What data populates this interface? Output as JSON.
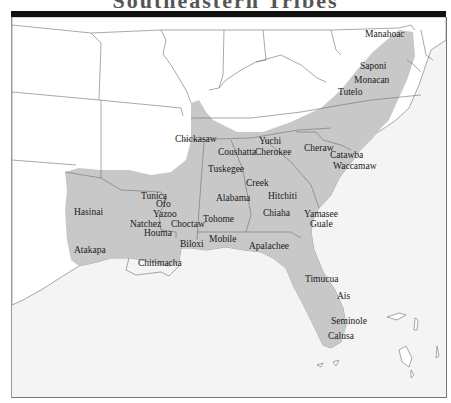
{
  "title": "Southeastern Tribes",
  "map": {
    "colors": {
      "territory": "#c8c8c8",
      "land": "#ffffff",
      "water": "#f4f4f4",
      "borders": "#6f6f6f",
      "frame_bar": "#111111"
    },
    "tribes": [
      {
        "name": "Manahoac",
        "x": 364,
        "y": 30
      },
      {
        "name": "Saponi",
        "x": 359,
        "y": 62
      },
      {
        "name": "Monacan",
        "x": 353,
        "y": 76
      },
      {
        "name": "Tutelo",
        "x": 337,
        "y": 88
      },
      {
        "name": "Yuchi",
        "x": 258,
        "y": 155
      },
      {
        "name": "Cherokee",
        "x": 254,
        "y": 168
      },
      {
        "name": "Chickasaw",
        "x": 174,
        "y": 135
      },
      {
        "name": "Coushatta",
        "x": 217,
        "y": 148
      },
      {
        "name": "Cheraw",
        "x": 303,
        "y": 144
      },
      {
        "name": "Catawba",
        "x": 329,
        "y": 151
      },
      {
        "name": "Waccamaw",
        "x": 332,
        "y": 162
      },
      {
        "name": "Tuskegee",
        "x": 207,
        "y": 165
      },
      {
        "name": "Creek",
        "x": 245,
        "y": 179
      },
      {
        "name": "Hitchiti",
        "x": 267,
        "y": 192
      },
      {
        "name": "Alabama",
        "x": 215,
        "y": 194
      },
      {
        "name": "Chiaha",
        "x": 262,
        "y": 209
      },
      {
        "name": "Yamasee",
        "x": 303,
        "y": 210
      },
      {
        "name": "Guale",
        "x": 309,
        "y": 220
      },
      {
        "name": "Tunica",
        "x": 140,
        "y": 192
      },
      {
        "name": "Ofo",
        "x": 155,
        "y": 200
      },
      {
        "name": "Yazoo",
        "x": 152,
        "y": 210
      },
      {
        "name": "Hasinai",
        "x": 73,
        "y": 208
      },
      {
        "name": "Natchez",
        "x": 129,
        "y": 220
      },
      {
        "name": "Choctaw",
        "x": 170,
        "y": 220
      },
      {
        "name": "Houma",
        "x": 143,
        "y": 229
      },
      {
        "name": "Tohome",
        "x": 202,
        "y": 215
      },
      {
        "name": "Mobile",
        "x": 208,
        "y": 235
      },
      {
        "name": "Biloxi",
        "x": 179,
        "y": 240
      },
      {
        "name": "Apalachee",
        "x": 248,
        "y": 242
      },
      {
        "name": "Atakapa",
        "x": 73,
        "y": 246
      },
      {
        "name": "Chitimacha",
        "x": 137,
        "y": 259
      },
      {
        "name": "Timucua",
        "x": 304,
        "y": 275
      },
      {
        "name": "Ais",
        "x": 336,
        "y": 292
      },
      {
        "name": "Seminole",
        "x": 330,
        "y": 317
      },
      {
        "name": "Calusa",
        "x": 327,
        "y": 332
      }
    ]
  }
}
